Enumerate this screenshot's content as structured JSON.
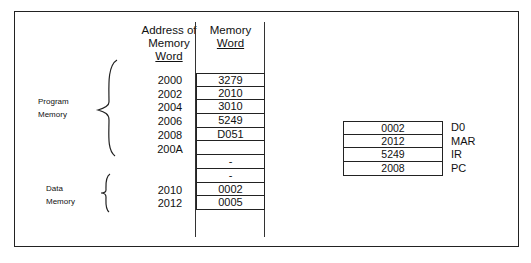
{
  "headers": {
    "address": [
      "Address of",
      "Memory",
      "Word"
    ],
    "memory": [
      "Memory",
      "Word"
    ]
  },
  "sections": {
    "program": [
      "Program",
      "Memory"
    ],
    "data": [
      "Data",
      "Memory"
    ]
  },
  "addresses": [
    "2000",
    "2002",
    "2004",
    "2006",
    "2008",
    "200A",
    "",
    "",
    "2010",
    "2012"
  ],
  "memory_words": [
    "3279",
    "2010",
    "3010",
    "5249",
    "D051",
    "",
    "-",
    "-",
    "0002",
    "0005"
  ],
  "registers": [
    {
      "value": "0002",
      "name": "D0"
    },
    {
      "value": "2012",
      "name": "MAR"
    },
    {
      "value": "5249",
      "name": "IR"
    },
    {
      "value": "2008",
      "name": "PC"
    }
  ]
}
